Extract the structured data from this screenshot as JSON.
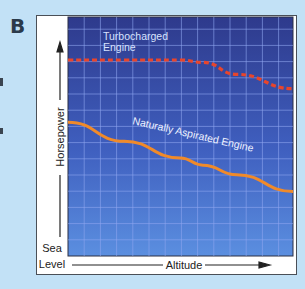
{
  "figure": {
    "panel_label": "B",
    "edge_marks": [
      80,
      130
    ]
  },
  "chart_data": {
    "type": "line",
    "title": "",
    "xlabel": "Altitude",
    "ylabel": "Horsepower",
    "x_origin_label": [
      "Sea",
      "Level"
    ],
    "grid": true,
    "x": [
      0,
      0.25,
      0.5,
      0.6,
      0.75,
      1.0
    ],
    "series": [
      {
        "name": "Turbocharged Engine",
        "label_lines": [
          "Turbocharged",
          "Engine"
        ],
        "style": "dashed",
        "color": "#e8452c",
        "values": [
          0.82,
          0.82,
          0.82,
          0.81,
          0.76,
          0.7
        ]
      },
      {
        "name": "Naturally Aspirated Engine",
        "label": "Naturally Aspirated Engine",
        "style": "solid",
        "color": "#f08a2a",
        "values": [
          0.56,
          0.48,
          0.41,
          0.38,
          0.34,
          0.27
        ]
      }
    ],
    "colors": {
      "plot_top": "#2e3d8e",
      "plot_bottom": "#5a8fe0",
      "grid": "#8fa8ee",
      "background": "#c2e1f6"
    }
  }
}
